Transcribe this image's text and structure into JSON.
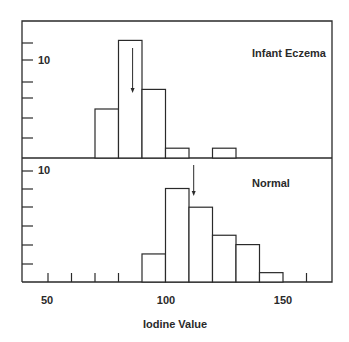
{
  "chart_data": [
    {
      "type": "bar",
      "title": "Infant Eczema",
      "xlabel": "Iodine Value",
      "ylabel": "",
      "bin_edges": [
        70,
        80,
        90,
        100,
        110,
        120,
        130
      ],
      "categories": [
        "70-80",
        "80-90",
        "90-100",
        "100-110",
        "110-120",
        "120-130"
      ],
      "values": [
        5,
        12,
        7,
        1,
        0,
        1
      ],
      "mean_arrow_x": 86,
      "y_tick_label": "10",
      "y_ticks": [
        2,
        4,
        6,
        8,
        10,
        12
      ],
      "ylim": [
        0,
        14
      ],
      "xlim": [
        40,
        172
      ]
    },
    {
      "type": "bar",
      "title": "Normal",
      "xlabel": "Iodine Value",
      "ylabel": "",
      "bin_edges": [
        90,
        100,
        110,
        120,
        130,
        140,
        150
      ],
      "categories": [
        "90-100",
        "100-110",
        "110-120",
        "120-130",
        "130-140",
        "140-150"
      ],
      "values": [
        3,
        10,
        8,
        5,
        4,
        1
      ],
      "mean_arrow_x": 112,
      "y_tick_label": "10",
      "y_ticks": [
        2,
        4,
        6,
        8,
        10,
        12
      ],
      "ylim": [
        0,
        13
      ],
      "x_ticks": [
        50,
        60,
        70,
        80,
        160
      ],
      "x_tick_labels": [
        "50",
        "100",
        "150"
      ],
      "xlim": [
        40,
        172
      ]
    }
  ],
  "labels": {
    "top_title": "Infant Eczema",
    "bottom_title": "Normal",
    "top_ytick": "10",
    "bottom_ytick": "10",
    "x_50": "50",
    "x_100": "100",
    "x_150": "150",
    "xlabel": "Iodine Value"
  }
}
